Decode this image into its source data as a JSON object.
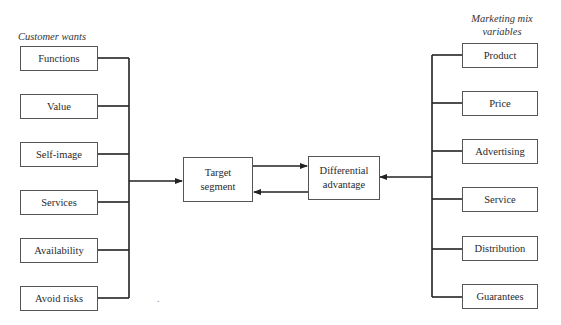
{
  "left_column": {
    "title": "Customer wants",
    "items": [
      {
        "label": "Functions"
      },
      {
        "label": "Value"
      },
      {
        "label": "Self-image"
      },
      {
        "label": "Services"
      },
      {
        "label": "Availability"
      },
      {
        "label": "Avoid risks"
      }
    ]
  },
  "right_column": {
    "title_line1": "Marketing mix",
    "title_line2": "variables",
    "items": [
      {
        "label": "Product"
      },
      {
        "label": "Price"
      },
      {
        "label": "Advertising"
      },
      {
        "label": "Service"
      },
      {
        "label": "Distribution"
      },
      {
        "label": "Guarantees"
      }
    ]
  },
  "center": {
    "target": {
      "line1": "Target",
      "line2": "segment"
    },
    "differential": {
      "line1": "Differential",
      "line2": "advantage"
    }
  },
  "colors": {
    "line": "#222222",
    "box_border": "#555555"
  }
}
